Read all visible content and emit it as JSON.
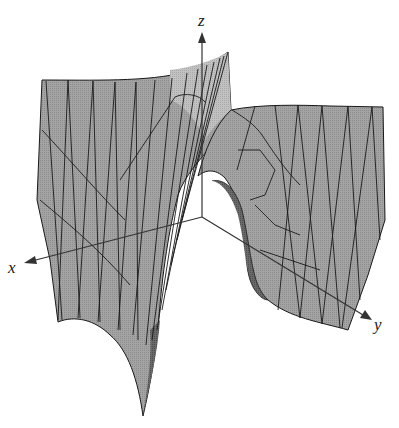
{
  "figure": {
    "colors": {
      "surface_fill": "#9a9a9a",
      "surface_light": "#b9b9b9",
      "surface_dark": "#5e5e5e",
      "mesh_line": "#1a1a1a",
      "axis": "#333333",
      "background": "#ffffff"
    }
  },
  "axes": {
    "x": {
      "label": "x"
    },
    "y": {
      "label": "y"
    },
    "z": {
      "label": "z"
    }
  }
}
